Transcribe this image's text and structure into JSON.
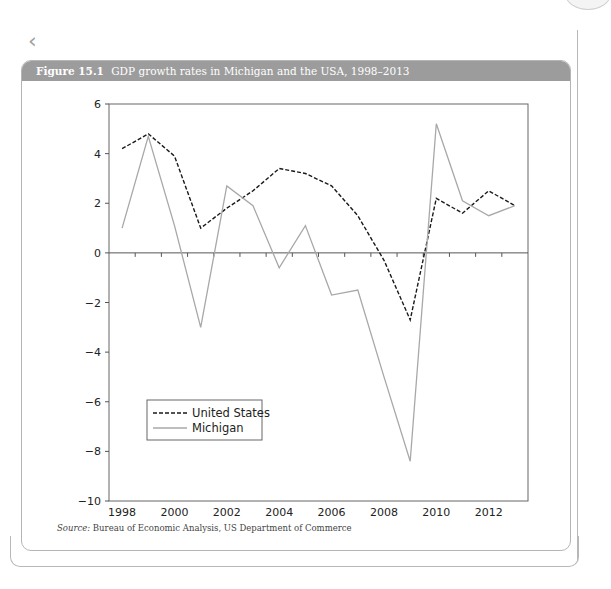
{
  "figure": {
    "label": "Figure 15.1",
    "title": "GDP growth rates in Michigan and the USA, 1998–2013",
    "source_label": "Source:",
    "source_text": "Bureau of Economic Analysis, US Department of Commerce"
  },
  "nav": {
    "back_icon": "chevron-left-icon"
  },
  "colors": {
    "header_bg": "#9c9c9c",
    "us_line": "#1a1a1a",
    "michigan_line": "#a8a8a8",
    "axis": "#555555"
  },
  "chart_data": {
    "type": "line",
    "title": "GDP growth rates in Michigan and the USA, 1998–2013",
    "xlabel": "",
    "ylabel": "",
    "x": [
      1998,
      1999,
      2000,
      2001,
      2002,
      2003,
      2004,
      2005,
      2006,
      2007,
      2008,
      2009,
      2010,
      2011,
      2012,
      2013
    ],
    "series": [
      {
        "name": "United States",
        "style": "dashed",
        "color": "#1a1a1a",
        "values": [
          4.2,
          4.8,
          3.9,
          1.0,
          1.8,
          2.5,
          3.4,
          3.2,
          2.7,
          1.5,
          -0.3,
          -2.7,
          2.2,
          1.6,
          2.5,
          1.9
        ]
      },
      {
        "name": "Michigan",
        "style": "solid",
        "color": "#a8a8a8",
        "values": [
          1.0,
          4.7,
          1.1,
          -3.0,
          2.7,
          1.9,
          -0.6,
          1.1,
          -1.7,
          -1.5,
          -5.0,
          -8.4,
          5.2,
          2.1,
          1.5,
          1.9
        ]
      }
    ],
    "ylim": [
      -10,
      6
    ],
    "yticks": [
      6,
      4,
      2,
      0,
      -2,
      -4,
      -6,
      -8,
      -10
    ],
    "ytick_labels": [
      "6",
      "4",
      "2",
      "0",
      "−2",
      "−4",
      "−6",
      "−8",
      "−10"
    ],
    "xtick_labels": [
      "1998",
      "2000",
      "2002",
      "2004",
      "2006",
      "2008",
      "2010",
      "2012"
    ],
    "grid": false,
    "legend": {
      "position": "lower left",
      "entries": [
        "United States",
        "Michigan"
      ]
    }
  }
}
